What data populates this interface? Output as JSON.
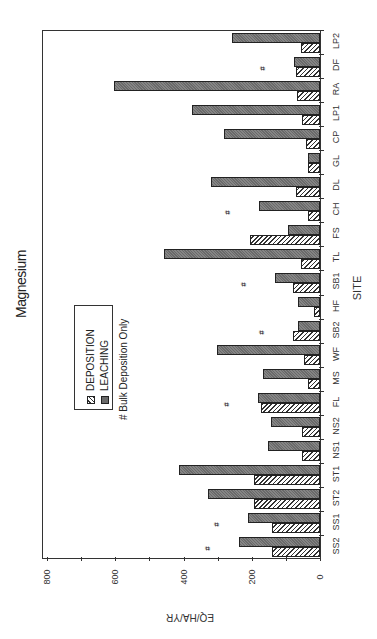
{
  "chart_data": {
    "type": "bar",
    "orientation": "rotated 90° (vertical bars drawn sideways; value axis horizontal, increasing to the left)",
    "title": "Magnesium",
    "xlabel": "SITE",
    "ylabel": "EQ/HA/YR",
    "ylim": [
      0,
      800
    ],
    "yticks": [
      0,
      200,
      400,
      600,
      800
    ],
    "minor_tick_step": 100,
    "grid": false,
    "legend_position": "upper-left (inside plot)",
    "categories": [
      "SS2",
      "SS1",
      "ST2",
      "ST1",
      "NS1",
      "NS2",
      "FL",
      "MS",
      "WF",
      "SB2",
      "HF",
      "SB1",
      "TL",
      "FS",
      "CH",
      "DL",
      "GL",
      "CP",
      "LP1",
      "RA",
      "DF",
      "LP2"
    ],
    "series": [
      {
        "name": "DEPOSITION",
        "pattern": "hatched",
        "values": [
          140,
          140,
          192,
          192,
          52,
          53,
          172,
          35,
          46,
          80,
          19,
          80,
          57,
          205,
          34,
          71,
          35,
          40,
          54,
          67,
          70,
          56
        ]
      },
      {
        "name": "LEACHING",
        "pattern": "dark-stipple",
        "values": [
          237,
          211,
          329,
          414,
          152,
          143,
          181,
          166,
          303,
          65,
          65,
          131,
          458,
          94,
          180,
          319,
          35,
          280,
          375,
          604,
          77,
          258
        ]
      }
    ],
    "annotations": {
      "marker": "#",
      "meaning": "# Bulk Deposition Only",
      "sites": [
        "SS2",
        "SS1",
        "FL",
        "SB2",
        "SB1",
        "CH",
        "DF"
      ]
    }
  },
  "title": "Magnesium",
  "axis": {
    "value_title": "EQ/HA/YR",
    "category_title": "SITE",
    "value_ticks": [
      "800",
      "600",
      "400",
      "200",
      "0"
    ]
  },
  "legend": {
    "deposition": "DEPOSITION",
    "leaching": "LEACHING",
    "note": "# Bulk Deposition Only"
  },
  "hash_symbol": "#"
}
